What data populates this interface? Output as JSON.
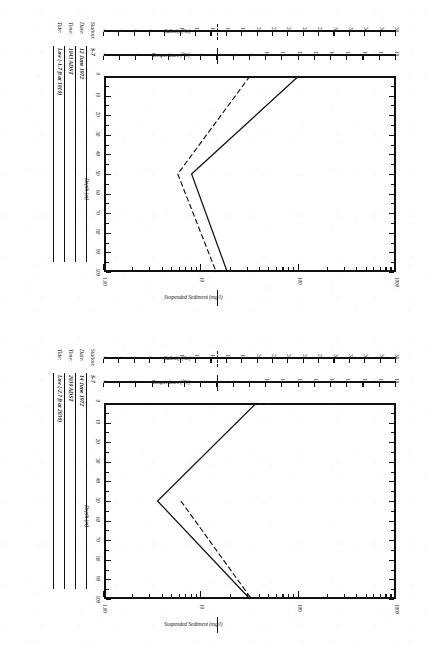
{
  "figure": {
    "orientation_note": "rotated-90-ccw",
    "x_axis": {
      "title": "Depth (m)",
      "ticks": [
        0,
        10,
        20,
        30,
        40,
        50,
        60,
        70,
        80,
        90,
        100
      ],
      "min": 0,
      "max": 100
    },
    "salinity_axis": {
      "title": "Salinity (‰)",
      "ticks": [
        0,
        2,
        4,
        6,
        8,
        10,
        12,
        14,
        16,
        18,
        20,
        22,
        24,
        26,
        28,
        30,
        32,
        34,
        36,
        38
      ],
      "min": 0,
      "max": 38,
      "line_style": "dashed"
    },
    "temperature_axis": {
      "title": "Temperature (°C)",
      "ticks": [
        0,
        1,
        2,
        3,
        4,
        5,
        6,
        7,
        8,
        9,
        10,
        11,
        12,
        13,
        14,
        15,
        16,
        17,
        18
      ],
      "min": 0,
      "max": 18,
      "line_style": "solid"
    },
    "sediment_axis": {
      "title": "Suspended Sediment (mg/l)",
      "ticks": [
        "1.00",
        "10",
        "100",
        "1000"
      ],
      "scale": "log",
      "line_style": "solid"
    }
  },
  "charts": [
    {
      "id": "chart-1",
      "info": {
        "station_label": "Station:",
        "station_value": "S-7",
        "date_label": "Date:",
        "date_value": "12 June 1972",
        "time_label": "Time:",
        "time_value": "1043 ADST",
        "tide_label": "Tide:",
        "tide_value": "Low (-1.7 ft at 1010)"
      },
      "chart_data": {
        "type": "line",
        "title": "Station S-7 — 12 June 1972",
        "xlabel": "Depth (m)",
        "ylabel": "Temperature (°C) / Salinity (‰) / Suspended Sediment (mg/l)",
        "xlim": [
          0,
          100
        ],
        "grid": false,
        "legend": "outboard stacked axes",
        "series": [
          {
            "name": "Temperature (°C)",
            "style": "solid",
            "axis": "temperature",
            "x": [
              0,
              50,
              100
            ],
            "values": [
              12.0,
              5.4,
              7.6
            ]
          },
          {
            "name": "Salinity (‰)",
            "style": "dashed",
            "axis": "salinity",
            "x": [
              0,
              50,
              100
            ],
            "values": [
              19.0,
              9.6,
              14.6
            ]
          }
        ]
      }
    },
    {
      "id": "chart-2",
      "info": {
        "station_label": "Station:",
        "station_value": "S-7",
        "date_label": "Date:",
        "date_value": "14 June 1972",
        "time_label": "Time:",
        "time_value": "2030 ADST",
        "tide_label": "Tide:",
        "tide_value": "Low (-2.7 ft at 2030)"
      },
      "chart_data": {
        "type": "line",
        "title": "Station S-7 — 14 June 1972",
        "xlabel": "Depth (m)",
        "ylabel": "Temperature (°C) / Salinity (‰) / Suspended Sediment (mg/l)",
        "xlim": [
          0,
          100
        ],
        "grid": false,
        "legend": "outboard stacked axes",
        "series": [
          {
            "name": "Temperature (°C)",
            "style": "solid",
            "axis": "temperature",
            "x": [
              0,
              50,
              100
            ],
            "values": [
              9.4,
              3.3,
              9.0
            ]
          },
          {
            "name": "Salinity (‰)",
            "style": "dashed",
            "axis": "salinity",
            "x": [
              50,
              100
            ],
            "values": [
              10.0,
              19.2
            ]
          }
        ]
      }
    }
  ]
}
